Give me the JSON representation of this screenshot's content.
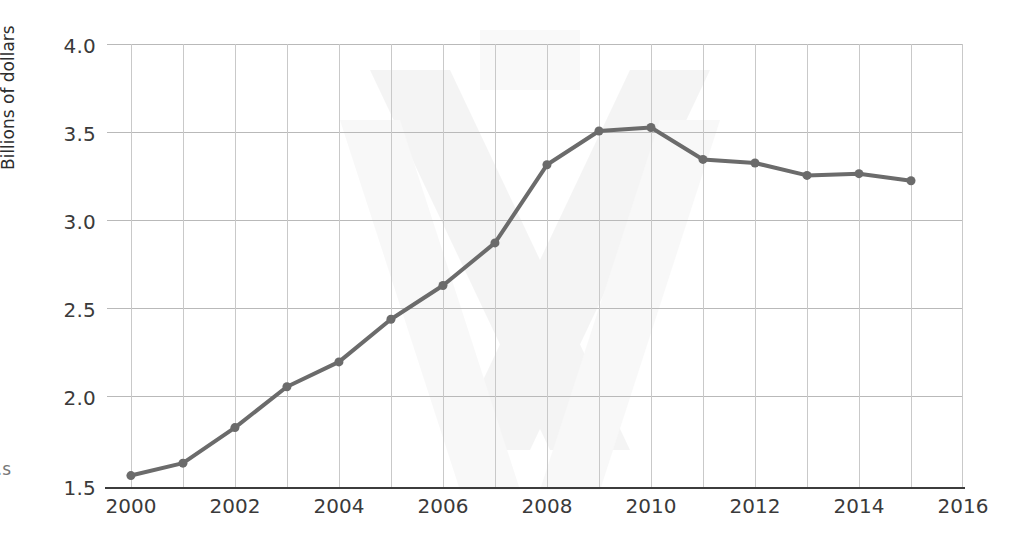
{
  "chart_data": {
    "type": "line",
    "title": "",
    "xlabel": "",
    "ylabel": "Billions of dollars",
    "xlim": [
      1999.54,
      2016.0
    ],
    "ylim": [
      1.5,
      4.0
    ],
    "grid": true,
    "legend": "none",
    "x_tick_labels": [
      "2000",
      "2002",
      "2004",
      "2006",
      "2008",
      "2010",
      "2012",
      "2014",
      "2016"
    ],
    "x_tick_values": [
      2000,
      2002,
      2004,
      2006,
      2008,
      2010,
      2012,
      2014,
      2016
    ],
    "x_minor_gridlines": [
      2001,
      2003,
      2005,
      2007,
      2009,
      2011,
      2013,
      2015
    ],
    "y_tick_labels": [
      "1.5",
      "2.0",
      "2.5",
      "3.0",
      "3.5",
      "4.0"
    ],
    "y_tick_values": [
      1.5,
      2.0,
      2.5,
      3.0,
      3.5,
      4.0
    ],
    "x": [
      2000,
      2001,
      2002,
      2003,
      2004,
      2005,
      2006,
      2007,
      2008,
      2009,
      2010,
      2011,
      2012,
      2013,
      2014,
      2015
    ],
    "values": [
      1.57,
      1.64,
      1.84,
      2.07,
      2.21,
      2.45,
      2.64,
      2.88,
      3.32,
      3.51,
      3.53,
      3.35,
      3.33,
      3.26,
      3.27,
      3.23
    ],
    "series": [
      {
        "name": "Billions of dollars",
        "values": [
          1.57,
          1.64,
          1.84,
          2.07,
          2.21,
          2.45,
          2.64,
          2.88,
          3.32,
          3.51,
          3.53,
          3.35,
          3.33,
          3.26,
          3.27,
          3.23
        ]
      }
    ],
    "line_color": "#6b6b6b",
    "marker_color": "#6b6b6b",
    "gridline_color": "#bdbdbd",
    "axis_color": "#3c3c3c",
    "marker": "circle",
    "marker_size": 9,
    "line_width": 4
  },
  "annotations": {
    "cropped_edge_text": "s."
  }
}
